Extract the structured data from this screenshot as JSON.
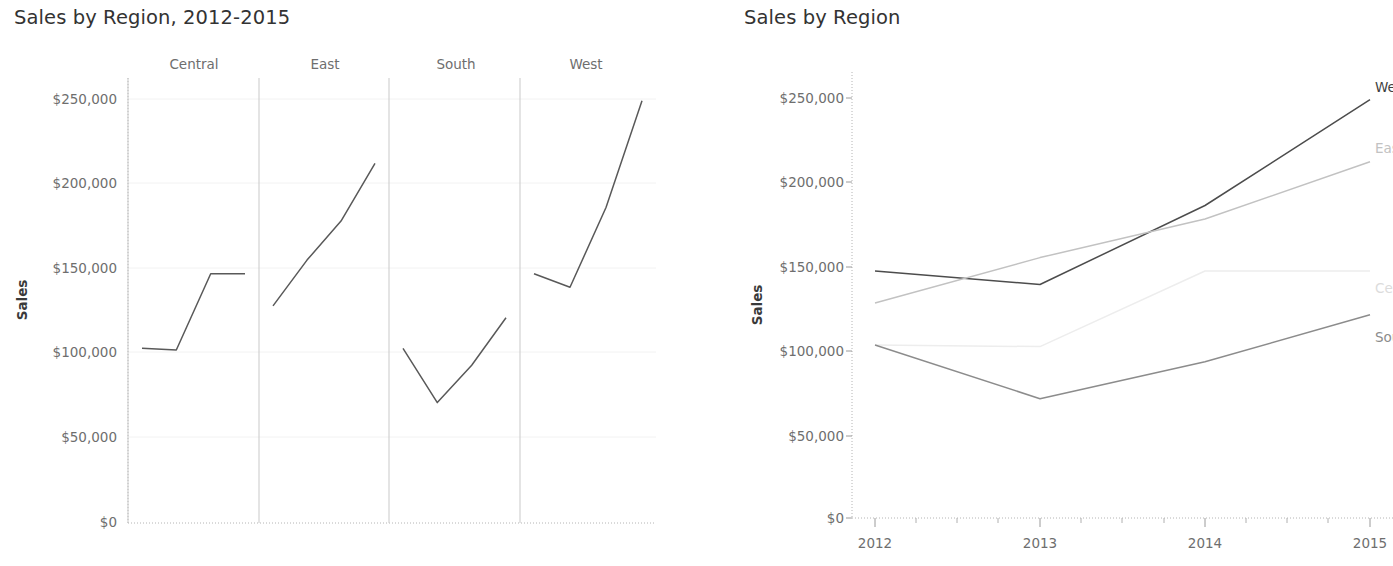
{
  "left": {
    "title": "Sales by Region, 2012-2015",
    "y_axis_name": "Sales",
    "y_tick_labels": [
      "$250,000",
      "$200,000",
      "$150,000",
      "$100,000",
      "$50,000",
      "$0"
    ],
    "panel_headers": [
      "Central",
      "East",
      "South",
      "West"
    ]
  },
  "right": {
    "title": "Sales by Region",
    "y_axis_name": "Sales",
    "y_tick_labels": [
      "$250,000",
      "$200,000",
      "$150,000",
      "$100,000",
      "$50,000",
      "$0"
    ],
    "x_tick_labels": [
      "2012",
      "2013",
      "2014",
      "2015"
    ],
    "series_labels": [
      "West",
      "East",
      "Central",
      "South"
    ]
  },
  "colors": {
    "West": "#4c4c4c",
    "East": "#c2c2c2",
    "Central": "#ededed",
    "South": "#8c8c8c",
    "left_line": "#595959",
    "tick_text": "#6e6e6e",
    "axis": "#9a9a9a",
    "divider": "#c9c9c9",
    "grid": "#f2f2f2",
    "title_text": "#333333"
  },
  "chart_data": [
    {
      "type": "line",
      "id": "left-small-multiples",
      "title": "Sales by Region, 2012-2015",
      "xlabel": "",
      "ylabel": "Sales",
      "ylim": [
        0,
        270000
      ],
      "yticks": [
        0,
        50000,
        100000,
        150000,
        200000,
        250000
      ],
      "ytick_labels": [
        "$0",
        "$50,000",
        "$100,000",
        "$150,000",
        "$200,000",
        "$250,000"
      ],
      "x": [
        2012,
        2013,
        2014,
        2015
      ],
      "grid": true,
      "legend": "none",
      "facets": [
        "Central",
        "East",
        "South",
        "West"
      ],
      "series": [
        {
          "name": "Central",
          "values": [
            103000,
            102000,
            147000,
            147000
          ]
        },
        {
          "name": "East",
          "values": [
            128000,
            155000,
            178000,
            212000
          ]
        },
        {
          "name": "South",
          "values": [
            103000,
            71000,
            93000,
            121000
          ]
        },
        {
          "name": "West",
          "values": [
            147000,
            139000,
            186000,
            249000
          ]
        }
      ]
    },
    {
      "type": "line",
      "id": "right-combined",
      "title": "Sales by Region",
      "xlabel": "",
      "ylabel": "Sales",
      "ylim": [
        0,
        270000
      ],
      "yticks": [
        0,
        50000,
        100000,
        150000,
        200000,
        250000
      ],
      "ytick_labels": [
        "$0",
        "$50,000",
        "$100,000",
        "$150,000",
        "$200,000",
        "$250,000"
      ],
      "x": [
        2012,
        2013,
        2014,
        2015
      ],
      "xtick_labels": [
        "2012",
        "2013",
        "2014",
        "2015"
      ],
      "grid": false,
      "legend": "line-end-labels",
      "series": [
        {
          "name": "West",
          "values": [
            147000,
            139000,
            186000,
            249000
          ],
          "color": "#4c4c4c"
        },
        {
          "name": "East",
          "values": [
            128000,
            155000,
            178000,
            212000
          ],
          "color": "#c2c2c2"
        },
        {
          "name": "Central",
          "values": [
            103000,
            102000,
            147000,
            147000
          ],
          "color": "#ededed"
        },
        {
          "name": "South",
          "values": [
            103000,
            71000,
            93000,
            121000
          ],
          "color": "#8c8c8c"
        }
      ]
    }
  ]
}
